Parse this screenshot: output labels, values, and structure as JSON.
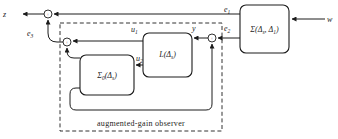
{
  "diagram": {
    "caption": "augmented-gain observer",
    "sum_sign": "+",
    "colors": {
      "line": "#1c1c1c",
      "background": "#ffffff"
    },
    "blocks": {
      "plant": {
        "p1": "Σ(Δ",
        "s1": "s",
        "p2": ", Δ",
        "s2": "1",
        "p3": ")"
      },
      "gain": {
        "p1": "L(Δ",
        "s1": "s",
        "p2": ")"
      },
      "model": {
        "p1": "Σ",
        "s1": "0",
        "p2": "(Δ",
        "s2": "s",
        "p3": ")"
      }
    },
    "signals": {
      "z": "z",
      "w": "w",
      "y": "y",
      "e1": {
        "base": "e",
        "sub": "1"
      },
      "e2": {
        "base": "e",
        "sub": "2"
      },
      "e3": {
        "base": "e",
        "sub": "3"
      },
      "u1": {
        "base": "u",
        "sub": "1"
      },
      "u2": {
        "base": "u",
        "sub": "2"
      }
    }
  }
}
